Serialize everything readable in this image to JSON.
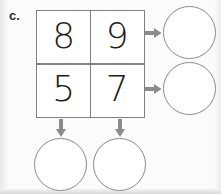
{
  "exercise": {
    "label": "c.",
    "type": "addition-grid-puzzle"
  },
  "grid": {
    "rows": 2,
    "columns": 2,
    "cells": [
      {
        "value": "8",
        "row": 0,
        "col": 0
      },
      {
        "value": "9",
        "row": 0,
        "col": 1
      },
      {
        "value": "5",
        "row": 1,
        "col": 0
      },
      {
        "value": "7",
        "row": 1,
        "col": 1
      }
    ]
  },
  "answers": {
    "row_totals": [
      {
        "name": "row-1-total",
        "value": ""
      },
      {
        "name": "row-2-total",
        "value": ""
      }
    ],
    "column_totals": [
      {
        "name": "column-1-total",
        "value": ""
      },
      {
        "name": "column-2-total",
        "value": ""
      }
    ]
  },
  "icons": {
    "arrow_right": "arrow-right-icon",
    "arrow_down": "arrow-down-icon"
  },
  "colors": {
    "page_background": "#fbfbfb",
    "grid_line": "#808080",
    "circle_outline": "#8a8a8a",
    "arrow": "#8a8a8a",
    "digit_text": "#1d1d1d",
    "label_text": "#2b2b2b"
  }
}
